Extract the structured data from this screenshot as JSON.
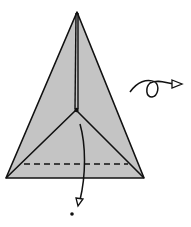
{
  "diagram": {
    "type": "origami-step",
    "colors": {
      "paper": "#c4c4c4",
      "line": "#111111",
      "background": "#ffffff"
    },
    "symbols": [
      {
        "name": "valley-fold-line",
        "style": "dashed"
      },
      {
        "name": "fold-arrow",
        "direction": "down"
      },
      {
        "name": "turn-over-arrow",
        "direction": "right"
      }
    ]
  }
}
